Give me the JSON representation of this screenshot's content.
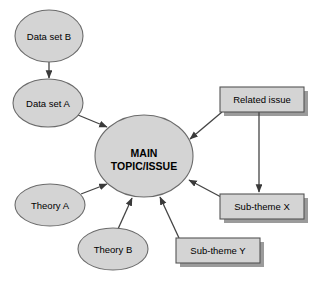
{
  "diagram": {
    "canvas": {
      "width": 328,
      "height": 289,
      "background": "#ffffff"
    },
    "style": {
      "node_fill": "#d4d4d4",
      "node_stroke": "#6b6b6b",
      "box_fill": "#d4d4d4",
      "box_stroke": "#555555",
      "shadow_color": "#8a8a8a",
      "arrow_color": "#444444",
      "text_color": "#000000"
    },
    "ellipses": [
      {
        "id": "data-set-b",
        "label": "Data set B",
        "cx": 49,
        "cy": 36,
        "rx": 34,
        "ry": 26,
        "font_size": 9.5,
        "bold": false
      },
      {
        "id": "data-set-a",
        "label": "Data set A",
        "cx": 48,
        "cy": 103,
        "rx": 35,
        "ry": 24,
        "font_size": 9.5,
        "bold": false
      },
      {
        "id": "main-topic",
        "label_line1": "MAIN",
        "label_line2": "TOPIC/ISSUE",
        "cx": 144,
        "cy": 156,
        "rx": 49,
        "ry": 41,
        "font_size": 10.5,
        "bold": true
      },
      {
        "id": "theory-a",
        "label": "Theory A",
        "cx": 50,
        "cy": 205,
        "rx": 35,
        "ry": 21,
        "font_size": 9.5,
        "bold": false
      },
      {
        "id": "theory-b",
        "label": "Theory B",
        "cx": 113,
        "cy": 249,
        "rx": 35,
        "ry": 21,
        "font_size": 9.5,
        "bold": false
      }
    ],
    "boxes": [
      {
        "id": "related-issue",
        "label": "Related issue",
        "x": 220,
        "y": 87,
        "w": 84,
        "h": 25,
        "font_size": 9.5
      },
      {
        "id": "sub-theme-x",
        "label": "Sub-theme X",
        "x": 220,
        "y": 194,
        "w": 84,
        "h": 25,
        "font_size": 9.5
      },
      {
        "id": "sub-theme-y",
        "label": "Sub-theme Y",
        "x": 176,
        "y": 238,
        "w": 84,
        "h": 25,
        "font_size": 9.5
      }
    ],
    "arrows": [
      {
        "id": "data-b-to-data-a",
        "from": "data-set-b",
        "to": "data-set-a",
        "x1": 49,
        "y1": 62,
        "x2": 49,
        "y2": 78
      },
      {
        "id": "data-a-to-main",
        "from": "data-set-a",
        "to": "main-topic",
        "x1": 78,
        "y1": 115,
        "x2": 107,
        "y2": 127
      },
      {
        "id": "theory-a-to-main",
        "from": "theory-a",
        "to": "main-topic",
        "x1": 81,
        "y1": 194,
        "x2": 107,
        "y2": 184
      },
      {
        "id": "theory-b-to-main",
        "from": "theory-b",
        "to": "main-topic",
        "x1": 118,
        "y1": 229,
        "x2": 132,
        "y2": 198
      },
      {
        "id": "sub-theme-y-to-main",
        "from": "sub-theme-y",
        "to": "main-topic",
        "x1": 179,
        "y1": 238,
        "x2": 160,
        "y2": 197
      },
      {
        "id": "sub-theme-x-to-main",
        "from": "sub-theme-x",
        "to": "main-topic",
        "x1": 221,
        "y1": 197,
        "x2": 189,
        "y2": 180
      },
      {
        "id": "related-issue-to-main",
        "from": "related-issue",
        "to": "main-topic",
        "x1": 222,
        "y1": 112,
        "x2": 190,
        "y2": 139
      },
      {
        "id": "related-issue-to-sub-theme-x",
        "from": "related-issue",
        "to": "sub-theme-x",
        "x1": 259,
        "y1": 112,
        "x2": 259,
        "y2": 192
      }
    ]
  }
}
